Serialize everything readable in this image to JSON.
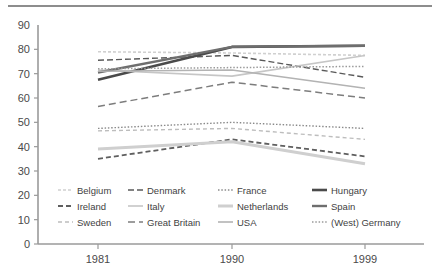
{
  "figure": {
    "background_color": "#ffffff",
    "rule_color": "#8d8d8d",
    "axis_color": "#9a9a9a"
  },
  "chart_data": {
    "type": "line",
    "title": "",
    "subtitle": "",
    "xlabel": "",
    "ylabel": "",
    "x": [
      "1981",
      "1990",
      "1999"
    ],
    "categories": [
      "1981",
      "1990",
      "1999"
    ],
    "ylim": [
      0,
      90
    ],
    "yticks": [
      0,
      10,
      20,
      30,
      40,
      50,
      60,
      70,
      80,
      90
    ],
    "ytick_labels": [
      "0",
      "10",
      "20",
      "30",
      "40",
      "50",
      "60",
      "70",
      "80",
      "90"
    ],
    "xtick_labels": [
      "1981",
      "1990",
      "1999"
    ],
    "grid": false,
    "legend_position": "inside-lower-left",
    "series": [
      {
        "name": "Belgium",
        "values": [
          79.0,
          78.5,
          77.5
        ],
        "color": "#d0d0d0",
        "dash": "3,2",
        "width": 1.6
      },
      {
        "name": "Denmark",
        "values": [
          75.5,
          77.5,
          68.5
        ],
        "color": "#595959",
        "dash": "6,3",
        "width": 1.4
      },
      {
        "name": "France",
        "values": [
          47.5,
          50.0,
          47.5
        ],
        "color": "#8a8a8a",
        "dash": "1.5,1.8",
        "width": 1.4
      },
      {
        "name": "Hungary",
        "values": [
          67.5,
          81.0,
          81.5
        ],
        "color": "#4a4a4a",
        "dash": "none",
        "width": 2.6
      },
      {
        "name": "Ireland",
        "values": [
          35.0,
          43.0,
          36.0
        ],
        "color": "#5f5f5f",
        "dash": "5,3",
        "width": 1.8
      },
      {
        "name": "Italy",
        "values": [
          71.5,
          69.0,
          77.5
        ],
        "color": "#c6c6c6",
        "dash": "none",
        "width": 1.6
      },
      {
        "name": "Netherlands",
        "values": [
          39.0,
          42.0,
          33.0
        ],
        "color": "#cfcfcf",
        "dash": "none",
        "width": 3.0
      },
      {
        "name": "Spain",
        "values": [
          70.5,
          81.0,
          81.5
        ],
        "color": "#6e6e6e",
        "dash": "none",
        "width": 2.4
      },
      {
        "name": "Sweden",
        "values": [
          46.5,
          47.5,
          43.0
        ],
        "color": "#bdbdbd",
        "dash": "4,3",
        "width": 1.4
      },
      {
        "name": "Great Britain",
        "values": [
          56.5,
          66.5,
          60.0
        ],
        "color": "#7d7d7d",
        "dash": "7,4",
        "width": 1.5
      },
      {
        "name": "USA",
        "values": [
          71.0,
          71.5,
          64.0
        ],
        "color": "#b3b3b3",
        "dash": "none",
        "width": 1.6
      },
      {
        "name": "(West) Germany",
        "values": [
          72.0,
          72.5,
          73.0
        ],
        "color": "#9a9a9a",
        "dash": "1.5,1.8",
        "width": 1.5
      }
    ],
    "legend_rows": [
      [
        "Belgium",
        "Denmark",
        "France",
        "Hungary"
      ],
      [
        "Ireland",
        "Italy",
        "Netherlands",
        "Spain"
      ],
      [
        "Sweden",
        "Great Britain",
        "USA",
        "(West) Germany"
      ]
    ]
  }
}
